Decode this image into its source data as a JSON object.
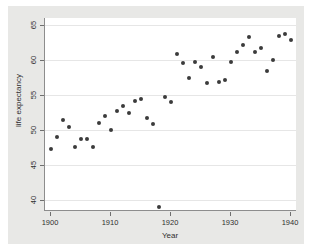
{
  "chart_data": {
    "type": "scatter",
    "title": "",
    "xlabel": "Year",
    "ylabel": "life expectancy",
    "xlim": [
      1899,
      1941
    ],
    "ylim": [
      38.5,
      66.0
    ],
    "xticks": [
      1900,
      1910,
      1920,
      1930,
      1940
    ],
    "yticks": [
      40,
      45,
      50,
      55,
      60,
      65
    ],
    "grid": "horizontal",
    "legend": "none",
    "marker_color": "#3b3b3b",
    "plot_background": "#ffffff",
    "graph_background": "#e8e8e6",
    "x": [
      1900,
      1901,
      1902,
      1903,
      1904,
      1905,
      1906,
      1907,
      1908,
      1909,
      1910,
      1911,
      1912,
      1913,
      1914,
      1915,
      1916,
      1917,
      1918,
      1919,
      1920,
      1921,
      1922,
      1923,
      1924,
      1925,
      1926,
      1927,
      1928,
      1929,
      1930,
      1931,
      1932,
      1933,
      1934,
      1935,
      1936,
      1937,
      1938,
      1939,
      1940
    ],
    "y": [
      47.3,
      49.1,
      51.5,
      50.5,
      47.6,
      48.7,
      48.7,
      47.6,
      51.1,
      52.1,
      50.0,
      52.7,
      53.5,
      52.5,
      54.2,
      54.5,
      51.7,
      50.9,
      39.1,
      54.7,
      54.1,
      60.8,
      59.6,
      57.4,
      59.7,
      59.0,
      56.7,
      60.4,
      56.9,
      57.1,
      59.7,
      61.1,
      62.1,
      63.3,
      61.1,
      61.7,
      58.5,
      60.0,
      63.5,
      63.7,
      62.9
    ],
    "series_name": "life expectancy",
    "n_points": 41,
    "outlier_note": "1918"
  },
  "axes": {
    "x_title": "Year",
    "y_title": "life expectancy",
    "x_tick_labels": [
      "1900",
      "1910",
      "1920",
      "1930",
      "1940"
    ],
    "y_tick_labels": [
      "40",
      "45",
      "50",
      "55",
      "60",
      "65"
    ]
  }
}
